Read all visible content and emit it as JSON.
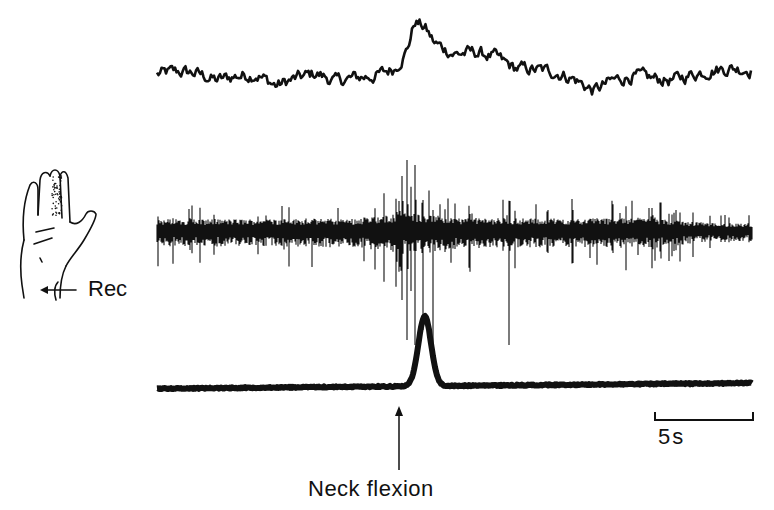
{
  "figure": {
    "electrode_label": "Rec",
    "scale_bar_label": "5s",
    "event_label": "Neck flexion"
  },
  "chart_data": {
    "type": "line",
    "title": "",
    "xlabel": "Time",
    "ylabel": "",
    "grid": false,
    "legend": null,
    "scale_bar": {
      "duration_s": 5,
      "label": "5s",
      "length_px": 98
    },
    "annotations": [
      {
        "text": "Neck flexion",
        "type": "arrow",
        "x_px": 399,
        "time_s": 12.6
      },
      {
        "text": "Rec",
        "type": "arrow-label",
        "target": "hand schematic (recording site at wrist)"
      }
    ],
    "series": [
      {
        "name": "top trace (slow fluctuating signal)",
        "note": "relative amplitude 0-1, baseline with peak after neck flexion",
        "x_s": [
          0,
          1,
          2,
          3,
          4,
          5,
          6,
          7,
          8,
          9,
          10,
          11,
          12,
          12.6,
          13,
          13.5,
          14,
          15,
          16,
          17,
          18,
          19,
          20,
          21,
          22,
          23,
          24,
          25,
          26,
          27,
          28,
          29,
          30
        ],
        "values": [
          0.35,
          0.38,
          0.36,
          0.28,
          0.33,
          0.35,
          0.22,
          0.3,
          0.36,
          0.27,
          0.31,
          0.33,
          0.42,
          0.62,
          0.95,
          0.88,
          0.7,
          0.58,
          0.6,
          0.55,
          0.42,
          0.4,
          0.38,
          0.3,
          0.16,
          0.28,
          0.33,
          0.3,
          0.28,
          0.35,
          0.4,
          0.42,
          0.4
        ]
      },
      {
        "name": "middle trace (multi-unit nerve/EMG recording)",
        "note": "spiky burst activity; increased burst amplitude near neck flexion; quieter after ~28 s",
        "x_s": [
          0,
          5,
          10,
          12.6,
          13.5,
          15,
          20,
          25,
          28,
          30
        ],
        "values": [
          0.5,
          0.5,
          0.55,
          1.0,
          0.95,
          0.6,
          0.55,
          0.6,
          0.15,
          0.15
        ]
      },
      {
        "name": "bottom trace (event/force signal)",
        "note": "flat baseline, single sharp peak coinciding with neck flexion",
        "x_s": [
          0,
          5,
          10,
          12.5,
          13.0,
          13.5,
          14.0,
          14.5,
          15,
          20,
          25,
          30
        ],
        "values": [
          0.0,
          0.02,
          0.04,
          0.08,
          0.5,
          1.0,
          0.55,
          0.1,
          0.05,
          0.06,
          0.08,
          0.1
        ]
      }
    ]
  }
}
